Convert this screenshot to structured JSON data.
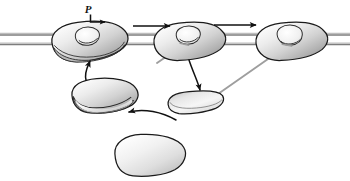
{
  "figure": {
    "width": 350,
    "height": 181,
    "background_color": "#ffffff"
  },
  "labels": {
    "phosphate_label": "P",
    "phosphate_label_x": 92,
    "phosphate_label_y": 13
  },
  "colors": {
    "outline": "#1a1a1a",
    "filament_line": "#8a8a8a",
    "filament_line_dark": "#6e6e6e",
    "body_light": "#f2f2f2",
    "body_mid": "#cfcfcf",
    "body_dark": "#9a9a9a",
    "tail_gray": "#9e9e9e",
    "arrow_black": "#111111"
  },
  "filament": {
    "name": "actin-filament-track",
    "x_start": 0,
    "x_end": 350,
    "line1_y": 34,
    "line2_y": 44,
    "stroke_width": 1.6
  },
  "motors": [
    {
      "id": "motor-bound-left",
      "name": "motor-head-bound-left",
      "state": "attached-pre-stroke",
      "cx": 90,
      "cy": 41,
      "rx": 38,
      "ry": 19,
      "rotation": -6,
      "has_cleft": true,
      "has_lower_lobe": true
    },
    {
      "id": "motor-bound-middle",
      "name": "motor-head-bound-middle",
      "state": "attached-power-stroke",
      "cx": 190,
      "cy": 41,
      "rx": 36,
      "ry": 18,
      "rotation": -6,
      "has_cleft": true,
      "has_lower_lobe": false
    },
    {
      "id": "motor-bound-right",
      "name": "motor-head-bound-right",
      "state": "attached-rigor",
      "cx": 292,
      "cy": 41,
      "rx": 36,
      "ry": 18,
      "rotation": -6,
      "has_cleft": true,
      "has_lower_lobe": false
    },
    {
      "id": "motor-detached-left",
      "name": "motor-head-detached-left",
      "state": "detached-cocked",
      "cx": 105,
      "cy": 95,
      "rx": 33,
      "ry": 16,
      "rotation": -4,
      "has_cleft": false,
      "has_lower_lobe": true
    },
    {
      "id": "motor-detached-middle",
      "name": "motor-head-detached-middle",
      "state": "detached-flat",
      "cx": 196,
      "cy": 102,
      "rx": 28,
      "ry": 11,
      "rotation": -5,
      "has_cleft": false,
      "has_lower_lobe": false
    },
    {
      "id": "motor-detached-bottom",
      "name": "motor-head-detached-bottom",
      "state": "detached-relaxed",
      "cx": 150,
      "cy": 155,
      "rx": 35,
      "ry": 21,
      "rotation": -3,
      "has_cleft": false,
      "has_lower_lobe": false
    }
  ],
  "tails": [
    {
      "name": "tail-stalk-middle",
      "from_x": 186,
      "from_y": 44,
      "to_x": 160,
      "to_y": 62,
      "color": "#9e9e9e"
    },
    {
      "name": "tail-stalk-right",
      "from_x": 286,
      "from_y": 45,
      "to_x": 219,
      "to_y": 93,
      "color": "#9e9e9e"
    }
  ],
  "arrows": [
    {
      "name": "arrow-step-left-to-middle",
      "type": "straight",
      "from_x": 134,
      "from_y": 26,
      "to_x": 172,
      "to_y": 26,
      "direction": "right"
    },
    {
      "name": "arrow-step-middle-to-right",
      "type": "straight",
      "from_x": 216,
      "from_y": 25,
      "to_x": 258,
      "to_y": 25,
      "direction": "right"
    },
    {
      "name": "arrow-phosphate-release",
      "type": "elbow",
      "from_x": 91,
      "from_y": 17,
      "to_x": 108,
      "to_y": 21,
      "direction": "right"
    },
    {
      "name": "arrow-rebind-upward",
      "type": "curved",
      "from_x": 86,
      "from_y": 81,
      "to_x": 90,
      "to_y": 62,
      "direction": "up"
    },
    {
      "name": "arrow-detach-downward",
      "type": "curved",
      "from_x": 190,
      "from_y": 62,
      "to_x": 200,
      "to_y": 93,
      "direction": "down"
    },
    {
      "name": "arrow-recock-leftward",
      "type": "curved",
      "from_x": 172,
      "from_y": 122,
      "to_x": 127,
      "to_y": 112,
      "direction": "left"
    }
  ]
}
